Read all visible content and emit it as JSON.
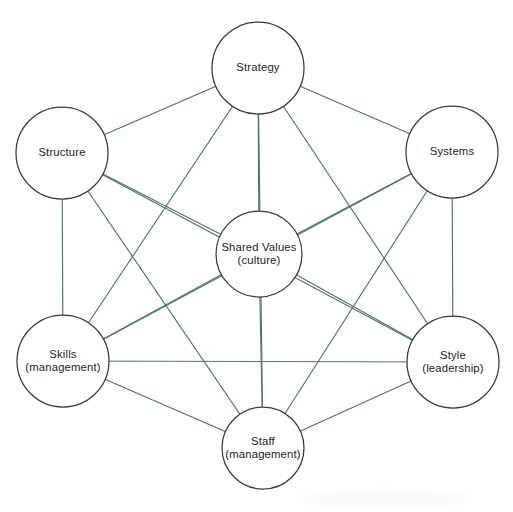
{
  "diagram": {
    "type": "network",
    "canvas": {
      "width": 513,
      "height": 512
    },
    "colors": {
      "background": "#ffffff",
      "edge": "#4f7470",
      "node_stroke": "#3a3a3a",
      "node_fill": "#ffffff",
      "label_text": "#232323"
    },
    "nodes": [
      {
        "id": "strategy",
        "label": "Strategy",
        "label_line2": "",
        "cx": 258,
        "cy": 68,
        "r": 46
      },
      {
        "id": "structure",
        "label": "Structure",
        "label_line2": "",
        "cx": 62,
        "cy": 153,
        "r": 46
      },
      {
        "id": "systems",
        "label": "Systems",
        "label_line2": "",
        "cx": 452,
        "cy": 152,
        "r": 46
      },
      {
        "id": "shared-values",
        "label": "Shared Values",
        "label_line2": "(culture)",
        "cx": 259,
        "cy": 254,
        "r": 43
      },
      {
        "id": "skills",
        "label": "Skills",
        "label_line2": "(management)",
        "cx": 63,
        "cy": 361,
        "r": 46
      },
      {
        "id": "style",
        "label": "Style",
        "label_line2": "(leadership)",
        "cx": 453,
        "cy": 362,
        "r": 46
      },
      {
        "id": "staff",
        "label": "Staff",
        "label_line2": "(management)",
        "cx": 263,
        "cy": 448,
        "r": 41
      }
    ],
    "edges": [
      {
        "from": "strategy",
        "to": "structure"
      },
      {
        "from": "strategy",
        "to": "systems"
      },
      {
        "from": "strategy",
        "to": "shared-values"
      },
      {
        "from": "strategy",
        "to": "skills"
      },
      {
        "from": "strategy",
        "to": "style"
      },
      {
        "from": "strategy",
        "to": "staff"
      },
      {
        "from": "structure",
        "to": "shared-values"
      },
      {
        "from": "structure",
        "to": "skills"
      },
      {
        "from": "structure",
        "to": "style"
      },
      {
        "from": "structure",
        "to": "staff"
      },
      {
        "from": "systems",
        "to": "shared-values"
      },
      {
        "from": "systems",
        "to": "skills"
      },
      {
        "from": "systems",
        "to": "style"
      },
      {
        "from": "systems",
        "to": "staff"
      },
      {
        "from": "shared-values",
        "to": "skills"
      },
      {
        "from": "shared-values",
        "to": "style"
      },
      {
        "from": "shared-values",
        "to": "staff"
      },
      {
        "from": "skills",
        "to": "style"
      },
      {
        "from": "skills",
        "to": "staff"
      },
      {
        "from": "style",
        "to": "staff"
      }
    ]
  }
}
